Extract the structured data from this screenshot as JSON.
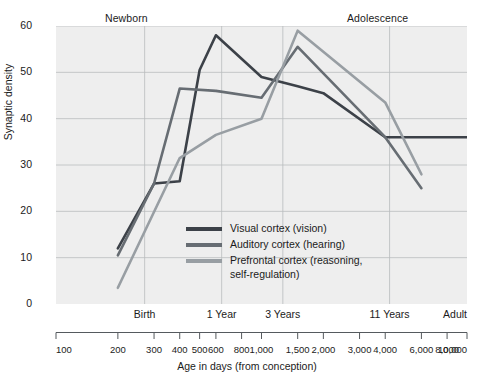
{
  "figure": {
    "era_labels": [
      {
        "name": "newborn",
        "text": "Newborn"
      },
      {
        "name": "adolescence",
        "text": "Adolescence"
      }
    ],
    "y_axis_title": "Synaptic density",
    "x_axis_title": "Age in days (from conception)",
    "plot_background": "#eeeeee",
    "grid_color": "#b9bcbe"
  },
  "legend": {
    "position": "inside-lower-center",
    "entries": [
      {
        "label": "Visual cortex (vision)",
        "color": "#3c4148"
      },
      {
        "label": "Auditory cortex (hearing)",
        "color": "#676d73"
      },
      {
        "label": "Prefrontal cortex (reasoning,\nself-regulation)",
        "color": "#989ea3"
      }
    ]
  },
  "chart_data": {
    "type": "line",
    "title": "",
    "subtitle": "",
    "xlabel": "Age in days (from conception)",
    "ylabel": "Synaptic density",
    "xscale": "log",
    "xlim": [
      100,
      10000
    ],
    "ylim": [
      0,
      60
    ],
    "grid": true,
    "y_ticks": [
      0,
      10,
      20,
      30,
      40,
      50,
      60
    ],
    "x_ticks": [
      100,
      200,
      300,
      400,
      500,
      600,
      800,
      1000,
      1500,
      2000,
      3000,
      4000,
      6000,
      8000,
      10000
    ],
    "x_tick_labels": [
      "100",
      "200",
      "300",
      "400",
      "500",
      "600",
      "800",
      "1,000",
      "1,500",
      "2,000",
      "3,000",
      "4,000",
      "6,000",
      "8,000",
      "10,000"
    ],
    "stage_annotations": [
      {
        "label": "Birth",
        "x": 270
      },
      {
        "label": "1 Year",
        "x": 640
      },
      {
        "label": "3 Years",
        "x": 1270
      },
      {
        "label": "11 Years",
        "x": 4200
      },
      {
        "label": "Adult",
        "x": 10000
      }
    ],
    "era_annotations": [
      {
        "label": "Newborn",
        "x": 330
      },
      {
        "label": "Adolescence",
        "x": 4600
      }
    ],
    "series": [
      {
        "name": "Visual cortex (vision)",
        "color": "#3c4148",
        "points": [
          {
            "x": 200,
            "y": 12
          },
          {
            "x": 300,
            "y": 26
          },
          {
            "x": 400,
            "y": 26.5
          },
          {
            "x": 500,
            "y": 50.5
          },
          {
            "x": 600,
            "y": 58
          },
          {
            "x": 1000,
            "y": 49
          },
          {
            "x": 1500,
            "y": 47
          },
          {
            "x": 2000,
            "y": 45.5
          },
          {
            "x": 4000,
            "y": 36
          },
          {
            "x": 10000,
            "y": 36
          }
        ]
      },
      {
        "name": "Auditory cortex (hearing)",
        "color": "#676d73",
        "points": [
          {
            "x": 200,
            "y": 10.5
          },
          {
            "x": 300,
            "y": 26
          },
          {
            "x": 400,
            "y": 46.5
          },
          {
            "x": 600,
            "y": 46
          },
          {
            "x": 1000,
            "y": 44.5
          },
          {
            "x": 1500,
            "y": 55.5
          },
          {
            "x": 4000,
            "y": 36
          },
          {
            "x": 6000,
            "y": 25
          }
        ]
      },
      {
        "name": "Prefrontal cortex (reasoning, self-regulation)",
        "color": "#989ea3",
        "points": [
          {
            "x": 200,
            "y": 3.5
          },
          {
            "x": 400,
            "y": 31.5
          },
          {
            "x": 600,
            "y": 36.5
          },
          {
            "x": 1000,
            "y": 40
          },
          {
            "x": 1500,
            "y": 59
          },
          {
            "x": 4000,
            "y": 43.5
          },
          {
            "x": 6000,
            "y": 28
          }
        ]
      }
    ]
  }
}
